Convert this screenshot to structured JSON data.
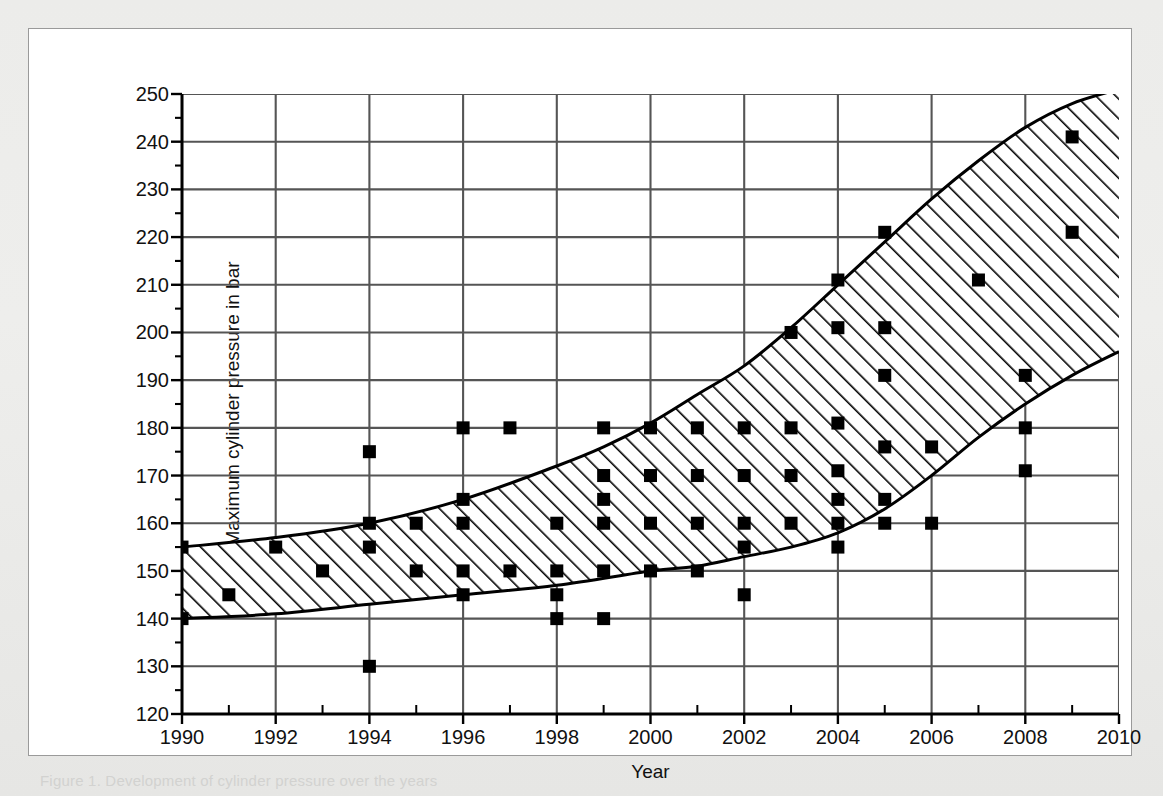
{
  "figure": {
    "caption": "Figure 1.  Development of cylinder pressure over the years",
    "background_color": "#ffffff",
    "border_color": "#9a9a9a"
  },
  "chart_data": {
    "type": "scatter",
    "title": "",
    "xlabel": "Year",
    "ylabel": "Maximum cylinder pressure in bar",
    "xlim": [
      1990,
      2010
    ],
    "ylim": [
      120,
      250
    ],
    "x_major_tick": 2,
    "x_minor_tick": 1,
    "y_major_tick": 10,
    "y_minor_tick": 5,
    "grid": true,
    "grid_color": "#555555",
    "xticks": [
      1990,
      1992,
      1994,
      1996,
      1998,
      2000,
      2002,
      2004,
      2006,
      2008,
      2010
    ],
    "xtick_labels": [
      "1990",
      "1992",
      "1994",
      "1996",
      "1998",
      "2000",
      "2002",
      "2004",
      "2006",
      "2008",
      "2010"
    ],
    "yticks": [
      120,
      130,
      140,
      150,
      160,
      170,
      180,
      190,
      200,
      210,
      220,
      230,
      240,
      250
    ],
    "ytick_labels": [
      "120",
      "130",
      "140",
      "150",
      "160",
      "170",
      "180",
      "190",
      "200",
      "210",
      "220",
      "230",
      "240",
      "250"
    ],
    "legend": [],
    "marker": "square",
    "marker_color": "#000000",
    "series": [
      {
        "name": "Maximum cylinder pressure",
        "points": [
          [
            1990,
            155
          ],
          [
            1990,
            140
          ],
          [
            1991,
            145
          ],
          [
            1992,
            155
          ],
          [
            1993,
            150
          ],
          [
            1994,
            175
          ],
          [
            1994,
            160
          ],
          [
            1994,
            155
          ],
          [
            1994,
            130
          ],
          [
            1995,
            160
          ],
          [
            1995,
            150
          ],
          [
            1996,
            180
          ],
          [
            1996,
            165
          ],
          [
            1996,
            160
          ],
          [
            1996,
            150
          ],
          [
            1996,
            145
          ],
          [
            1997,
            180
          ],
          [
            1997,
            150
          ],
          [
            1998,
            160
          ],
          [
            1998,
            150
          ],
          [
            1998,
            145
          ],
          [
            1998,
            140
          ],
          [
            1999,
            180
          ],
          [
            1999,
            170
          ],
          [
            1999,
            165
          ],
          [
            1999,
            160
          ],
          [
            1999,
            150
          ],
          [
            1999,
            140
          ],
          [
            2000,
            180
          ],
          [
            2000,
            170
          ],
          [
            2000,
            160
          ],
          [
            2000,
            150
          ],
          [
            2001,
            180
          ],
          [
            2001,
            170
          ],
          [
            2001,
            160
          ],
          [
            2001,
            150
          ],
          [
            2002,
            180
          ],
          [
            2002,
            170
          ],
          [
            2002,
            160
          ],
          [
            2002,
            155
          ],
          [
            2002,
            145
          ],
          [
            2003,
            200
          ],
          [
            2003,
            180
          ],
          [
            2003,
            170
          ],
          [
            2003,
            160
          ],
          [
            2004,
            211
          ],
          [
            2004,
            201
          ],
          [
            2004,
            181
          ],
          [
            2004,
            171
          ],
          [
            2004,
            165
          ],
          [
            2004,
            160
          ],
          [
            2004,
            155
          ],
          [
            2005,
            221
          ],
          [
            2005,
            201
          ],
          [
            2005,
            191
          ],
          [
            2005,
            176
          ],
          [
            2005,
            165
          ],
          [
            2005,
            160
          ],
          [
            2006,
            176
          ],
          [
            2006,
            160
          ],
          [
            2007,
            211
          ],
          [
            2008,
            191
          ],
          [
            2008,
            180
          ],
          [
            2008,
            171
          ],
          [
            2009,
            241
          ],
          [
            2009,
            221
          ]
        ]
      }
    ],
    "band": {
      "name": "hatched development corridor",
      "fill": "diagonal-hatch",
      "upper": [
        [
          1990,
          155
        ],
        [
          1992,
          157
        ],
        [
          1994,
          160
        ],
        [
          1996,
          165
        ],
        [
          1998,
          172
        ],
        [
          1999,
          176
        ],
        [
          2000,
          181
        ],
        [
          2001,
          187
        ],
        [
          2002,
          193
        ],
        [
          2003,
          201
        ],
        [
          2004,
          210
        ],
        [
          2005,
          219
        ],
        [
          2006,
          228
        ],
        [
          2007,
          236
        ],
        [
          2008,
          243
        ],
        [
          2009,
          248
        ],
        [
          2010,
          251
        ]
      ],
      "lower": [
        [
          1990,
          140
        ],
        [
          1992,
          141
        ],
        [
          1994,
          143
        ],
        [
          1996,
          145
        ],
        [
          1998,
          147
        ],
        [
          2000,
          150
        ],
        [
          2001,
          151
        ],
        [
          2002,
          153
        ],
        [
          2003,
          155
        ],
        [
          2004,
          158
        ],
        [
          2005,
          163
        ],
        [
          2006,
          170
        ],
        [
          2007,
          178
        ],
        [
          2008,
          185
        ],
        [
          2009,
          191
        ],
        [
          2010,
          196
        ]
      ]
    }
  }
}
